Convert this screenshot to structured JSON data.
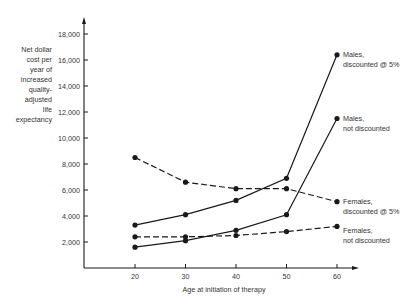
{
  "chart_data": {
    "type": "line",
    "title": "",
    "xlabel": "Age at initiation of therapy",
    "ylabel": "Net dollar cost per year of increased quality-adjusted life expectancy",
    "ylabel_lines": [
      "Net dollar",
      "cost per",
      "year of",
      "increased",
      "quality-",
      "adjusted",
      "life",
      "expectancy"
    ],
    "x": [
      20,
      30,
      40,
      50,
      60
    ],
    "x_ticks": [
      "20",
      "30",
      "40",
      "50",
      "60"
    ],
    "y_ticks": [
      "2,000",
      "4,000",
      "6,000",
      "8,000",
      "10,000",
      "12,000",
      "14,000",
      "16,000",
      "18,000"
    ],
    "y_tick_values": [
      2000,
      4000,
      6000,
      8000,
      10000,
      12000,
      14000,
      16000,
      18000
    ],
    "ylim": [
      0,
      19000
    ],
    "xlim": [
      10,
      65
    ],
    "grid": false,
    "legend_position": "inline-right",
    "series": [
      {
        "name": "Males, discounted @ 5%",
        "label_lines": [
          "Males,",
          "discounted @ 5%"
        ],
        "style": "solid",
        "values": [
          3300,
          4100,
          5200,
          6900,
          16400
        ]
      },
      {
        "name": "Males, not discounted",
        "label_lines": [
          "Males,",
          "not discounted"
        ],
        "style": "solid",
        "values": [
          1600,
          2100,
          2900,
          4100,
          11500
        ]
      },
      {
        "name": "Females, discounted @ 5%",
        "label_lines": [
          "Females,",
          "discounted @ 5%"
        ],
        "style": "dashed",
        "values": [
          8500,
          6600,
          6100,
          6100,
          5100
        ]
      },
      {
        "name": "Females, not discounted",
        "label_lines": [
          "Females,",
          "not discounted"
        ],
        "style": "dashed",
        "values": [
          2400,
          2400,
          2500,
          2800,
          3200
        ]
      }
    ]
  },
  "colors": {
    "line": "#1a1a1a",
    "text": "#333333",
    "background": "#ffffff"
  }
}
